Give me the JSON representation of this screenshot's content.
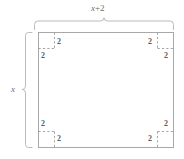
{
  "figure": {
    "title_label": "x + 2",
    "title_var": "x",
    "title_op": "+",
    "title_num": "2",
    "side_label": "x",
    "corner_value": "2",
    "colors": {
      "outline": "#a8a8a8",
      "dashed": "#9a9a9a",
      "brace": "#b0b0b0",
      "text": "#6d6d6d",
      "background": "#ffffff"
    },
    "rectangle": {
      "left": 38,
      "top": 32,
      "right": 174,
      "bottom": 148,
      "width_label": "x + 2",
      "height_label": "x"
    },
    "corners": [
      {
        "name": "top-left",
        "vertical_label": "2",
        "horizontal_label": "2",
        "size": 16
      },
      {
        "name": "top-right",
        "vertical_label": "2",
        "horizontal_label": "2",
        "size": 16
      },
      {
        "name": "bottom-left",
        "vertical_label": "2",
        "horizontal_label": "2",
        "size": 16
      },
      {
        "name": "bottom-right",
        "vertical_label": "2",
        "horizontal_label": "2",
        "size": 16
      }
    ],
    "labels": [
      {
        "id": "top-dimension",
        "text": "x + 2"
      },
      {
        "id": "left-dimension",
        "text": "x"
      },
      {
        "id": "tl-vertical",
        "text": "2"
      },
      {
        "id": "tl-horizontal",
        "text": "2"
      },
      {
        "id": "tr-vertical",
        "text": "2"
      },
      {
        "id": "tr-horizontal",
        "text": "2"
      },
      {
        "id": "bl-vertical",
        "text": "2"
      },
      {
        "id": "bl-horizontal",
        "text": "2"
      },
      {
        "id": "br-vertical",
        "text": "2"
      },
      {
        "id": "br-horizontal",
        "text": "2"
      }
    ]
  }
}
